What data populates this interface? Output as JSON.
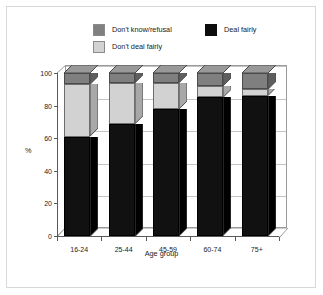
{
  "chart_data": {
    "type": "bar",
    "subtype": "stacked-3d-column",
    "title": "",
    "xlabel": "Age group",
    "ylabel": "%",
    "categories": [
      "16-24",
      "25-44",
      "45-59",
      "60-74",
      "75+"
    ],
    "ylim": [
      0,
      100
    ],
    "yticks": [
      0,
      20,
      40,
      60,
      80,
      100
    ],
    "ytick_labels": [
      "0",
      "20",
      "40",
      "60",
      "80",
      "100"
    ],
    "grid": true,
    "legend_position": "top",
    "stack_order_bottom_to_top": [
      "Deal fairly",
      "Don't deal fairly",
      "Don't know/refusal"
    ],
    "series": [
      {
        "name": "Deal fairly",
        "color": "#111111",
        "values": [
          61,
          69,
          78,
          85,
          86
        ]
      },
      {
        "name": "Don't deal fairly",
        "color": "#d2d2d2",
        "values": [
          32,
          25,
          16,
          7,
          4
        ]
      },
      {
        "name": "Don't know/refusal",
        "color": "#7f7f7f",
        "values": [
          7,
          6,
          6,
          8,
          10
        ]
      }
    ]
  },
  "legend": {
    "items": [
      {
        "label": "Don't know/refusal",
        "swatch": "dark-gray-swatch"
      },
      {
        "label": "Don't deal fairly",
        "swatch": "light-gray-swatch"
      },
      {
        "label": "Deal fairly",
        "swatch": "black-swatch"
      }
    ]
  },
  "axes": {
    "y_label": "%",
    "x_label": "Age group",
    "y_ticks": [
      "0",
      "20",
      "40",
      "60",
      "80",
      "100"
    ],
    "x_ticks": [
      "16-24",
      "25-44",
      "45-59",
      "60-74",
      "75+"
    ]
  },
  "colors": {
    "deal_fairly": "#111111",
    "dont_deal_fairly": "#d2d2d2",
    "dont_know_refusal": "#7f7f7f",
    "grid": "#c4c4c4",
    "axis": "#5a5a5a",
    "frame": "#d8d8d8",
    "background": "#ffffff"
  }
}
